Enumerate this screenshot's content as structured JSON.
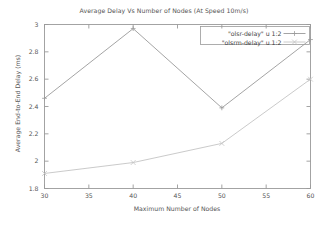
{
  "chart_data": {
    "type": "line",
    "title": "Average Delay Vs Number of Nodes (At Speed 10m/s)",
    "xlabel": "Maximum Number of Nodes",
    "ylabel": "Average End-to-End Delay (ms)",
    "x": [
      30,
      40,
      50,
      60
    ],
    "xlim": [
      30,
      60
    ],
    "ylim": [
      1.8,
      3.0
    ],
    "xticks": [
      "30",
      "35",
      "40",
      "45",
      "50",
      "55",
      "60"
    ],
    "xtick_values": [
      30,
      35,
      40,
      45,
      50,
      55,
      60
    ],
    "yticks": [
      "1.8",
      "2",
      "2.2",
      "2.4",
      "2.6",
      "2.8",
      "3"
    ],
    "ytick_values": [
      1.8,
      2.0,
      2.2,
      2.4,
      2.6,
      2.8,
      3.0
    ],
    "grid": false,
    "legend_position": "top-right",
    "series": [
      {
        "name": "\"olsr-delay\" u 1:2",
        "values": [
          2.46,
          2.97,
          2.39,
          2.89
        ],
        "color": "#9a9a9a",
        "marker": "plus"
      },
      {
        "name": "\"olsrm-delay\" u 1:2",
        "values": [
          1.91,
          1.99,
          2.13,
          2.6
        ],
        "color": "#c4c4c4",
        "marker": "cross"
      }
    ]
  },
  "colors": {
    "axis": "#9a9a9a",
    "text": "#555555",
    "background": "#ffffff"
  }
}
